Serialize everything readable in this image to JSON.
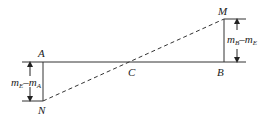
{
  "diagram": {
    "points": {
      "A": "A",
      "B": "B",
      "C": "C",
      "M": "M",
      "N": "N"
    },
    "left_dimension": {
      "m1": "m",
      "sub1": "E",
      "minus": "–",
      "m2": "m",
      "sub2": "A"
    },
    "right_dimension": {
      "m1": "m",
      "sub1": "B",
      "minus": "–",
      "m2": "m",
      "sub2": "E"
    },
    "colors": {
      "line": "#333333"
    }
  }
}
